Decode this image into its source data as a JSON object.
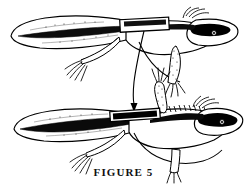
{
  "figure": {
    "caption": "FIGURE 5",
    "type": "scientific-line-illustration",
    "background_color": "#ffffff",
    "ink_color": "#000000",
    "specimens": [
      {
        "id": "upper-salamander",
        "label": "upper-salamander",
        "orientation": "facing right",
        "tail": "broad flattened paddle-shaped tail at left",
        "head_marking": "dark elongated dorsal head blotch",
        "tag": {
          "name": "dorsal-tag-band",
          "style": "white rectangle outline over dark dorsal stripe"
        }
      },
      {
        "id": "lower-salamander",
        "label": "lower-salamander",
        "orientation": "facing right",
        "tail": "broad flattened paddle-shaped tail at left with dark median stripe",
        "head_marking": "dark elongated dorsal head blotch",
        "crest": "serrated dorsal crest along back",
        "tag": {
          "name": "dorsal-tag-band",
          "style": "solid black rectangle with white outline"
        }
      }
    ],
    "annotation": {
      "name": "leader-line-with-arrow",
      "description": "curved leader line from upper specimen tag down to arrowhead at lower specimen tag",
      "arrow_direction": "down"
    }
  }
}
